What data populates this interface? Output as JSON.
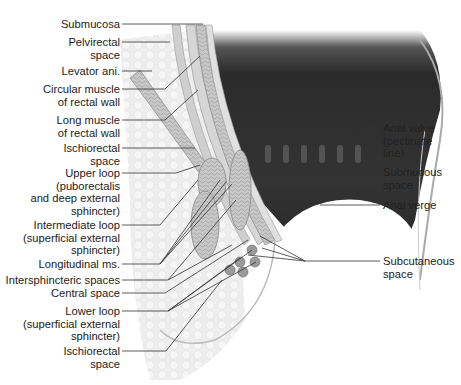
{
  "diagram": {
    "type": "anatomical-cross-section",
    "colors": {
      "lumen": "#2e2e2e",
      "tissue": "#d8d8d8",
      "muscle": "#bdbdbd",
      "leader_line": "#333333",
      "text": "#222222"
    },
    "left_labels": [
      {
        "id": "submucosa",
        "text": "Submucosa"
      },
      {
        "id": "pelvirectal-space",
        "text": "Pelvirectal\nspace"
      },
      {
        "id": "levator-ani",
        "text": "Levator ani."
      },
      {
        "id": "circular-muscle",
        "text": "Circular muscle\nof rectal wall"
      },
      {
        "id": "long-muscle",
        "text": "Long muscle\nof rectal wall"
      },
      {
        "id": "ischiorectal-space-upper",
        "text": "Ischiorectal\nspace"
      },
      {
        "id": "upper-loop",
        "text": "Upper loop\n(puborectalis\nand deep external\nsphincter)"
      },
      {
        "id": "intermediate-loop",
        "text": "Intermediate loop\n(superficial external\nsphincter)"
      },
      {
        "id": "longitudinal-ms",
        "text": "Longitudinal ms."
      },
      {
        "id": "intersphincteric-spaces",
        "text": "Intersphincteric spaces"
      },
      {
        "id": "central-space",
        "text": "Central space"
      },
      {
        "id": "lower-loop",
        "text": "Lower loop\n(superficial external\nsphincter)"
      },
      {
        "id": "ischiorectal-space-lower",
        "text": "Ischiorectal\nspace"
      }
    ],
    "right_labels": [
      {
        "id": "anal-valve",
        "text": "Anal valve\n(pectinate\nline)"
      },
      {
        "id": "submucous-space",
        "text": "Submucous\nspace"
      },
      {
        "id": "anal-verge",
        "text": "Anal verge"
      },
      {
        "id": "subcutaneous-space",
        "text": "Subcutaneous\nspace"
      }
    ]
  }
}
